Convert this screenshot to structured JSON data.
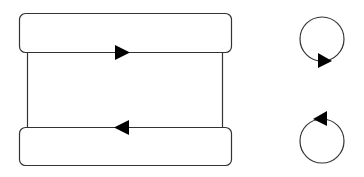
{
  "diagram": {
    "colors": {
      "stroke": "#333333",
      "arrow_fill": "#000000",
      "background": "#ffffff"
    },
    "loop": {
      "top_box": {
        "x": 19,
        "y": 13,
        "width": 212,
        "height": 39,
        "radius": 6
      },
      "bottom_box": {
        "x": 19,
        "y": 128,
        "width": 212,
        "height": 38,
        "radius": 6
      },
      "left_line_x": 27,
      "right_line_x": 222,
      "top_arrow": {
        "direction": "right",
        "tip_x": 129,
        "y": 52
      },
      "bottom_arrow": {
        "direction": "left",
        "tip_x": 114,
        "y": 127
      }
    },
    "rotation_icons": [
      {
        "name": "clockwise",
        "cx": 322,
        "cy": 39,
        "r": 22,
        "arrow_direction": "right",
        "arrow_position": "bottom"
      },
      {
        "name": "counter-clockwise",
        "cx": 322,
        "cy": 141,
        "r": 22,
        "arrow_direction": "left",
        "arrow_position": "top"
      }
    ]
  }
}
